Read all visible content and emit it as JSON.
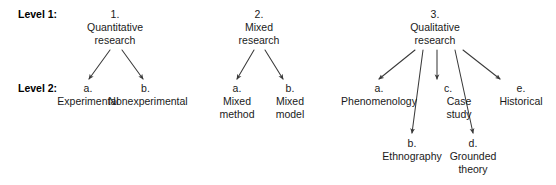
{
  "diagram": {
    "text_color": "#1a1a1a",
    "line_color": "#3a3a3a",
    "background": "#ffffff",
    "level_labels": [
      {
        "id": "level-1",
        "text": "Level 1:",
        "x": 18,
        "y": 8
      },
      {
        "id": "level-2",
        "text": "Level 2:",
        "x": 18,
        "y": 82
      }
    ],
    "nodes": [
      {
        "id": "quantitative-research",
        "enum": "1.",
        "lines": [
          "Quantitative",
          "research"
        ],
        "cx": 115,
        "top": 8
      },
      {
        "id": "mixed-research",
        "enum": "2.",
        "lines": [
          "Mixed",
          "research"
        ],
        "cx": 259,
        "top": 8
      },
      {
        "id": "qualitative-research",
        "enum": "3.",
        "lines": [
          "Qualitative",
          "research"
        ],
        "cx": 435,
        "top": 8
      },
      {
        "id": "experimental",
        "enum": "a.",
        "lines": [
          "Experimental"
        ],
        "cx": 88,
        "top": 82
      },
      {
        "id": "nonexperimental",
        "enum": "b.",
        "lines": [
          "Nonexperimental"
        ],
        "cx": 148,
        "top": 82
      },
      {
        "id": "mixed-method",
        "enum": "a.",
        "lines": [
          "Mixed",
          "method"
        ],
        "cx": 237,
        "top": 82
      },
      {
        "id": "mixed-model",
        "enum": "b.",
        "lines": [
          "Mixed",
          "model"
        ],
        "cx": 290,
        "top": 82
      },
      {
        "id": "phenomenology",
        "enum": "a.",
        "lines": [
          "Phenomenology"
        ],
        "cx": 379,
        "top": 82
      },
      {
        "id": "case-study",
        "enum": "c.",
        "lines": [
          "Case",
          "study"
        ],
        "cx": 459,
        "top": 82
      },
      {
        "id": "historical",
        "enum": "e.",
        "lines": [
          "Historical"
        ],
        "cx": 521,
        "top": 82
      },
      {
        "id": "ethnography",
        "enum": "b.",
        "lines": [
          "Ethnography"
        ],
        "cx": 412,
        "top": 137
      },
      {
        "id": "grounded-theory",
        "enum": "d.",
        "lines": [
          "Grounded",
          "theory"
        ],
        "cx": 473,
        "top": 137
      }
    ],
    "edges": [
      {
        "id": "quantitative-to-experimental",
        "x1": 110,
        "y1": 50,
        "x2": 89,
        "y2": 79
      },
      {
        "id": "quantitative-to-nonexperimental",
        "x1": 122,
        "y1": 50,
        "x2": 143,
        "y2": 79
      },
      {
        "id": "mixed-to-mixed-method",
        "x1": 254,
        "y1": 50,
        "x2": 237,
        "y2": 79
      },
      {
        "id": "mixed-to-mixed-model",
        "x1": 265,
        "y1": 50,
        "x2": 283,
        "y2": 79
      },
      {
        "id": "qualitative-to-phenomenology",
        "x1": 415,
        "y1": 50,
        "x2": 379,
        "y2": 79
      },
      {
        "id": "qualitative-to-ethnography",
        "x1": 423,
        "y1": 50,
        "x2": 412,
        "y2": 133
      },
      {
        "id": "qualitative-to-case-study",
        "x1": 437,
        "y1": 50,
        "x2": 437,
        "y2": 79
      },
      {
        "id": "qualitative-to-grounded-theory",
        "x1": 455,
        "y1": 50,
        "x2": 473,
        "y2": 133
      },
      {
        "id": "qualitative-to-historical",
        "x1": 463,
        "y1": 50,
        "x2": 500,
        "y2": 79
      }
    ]
  }
}
